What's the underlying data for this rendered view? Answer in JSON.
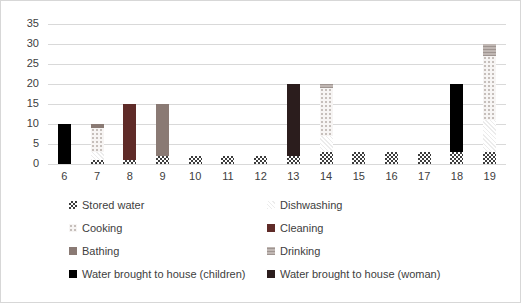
{
  "figure": {
    "background": "#ffffff",
    "border_color": "#d7d7d7",
    "text_color": "#404040",
    "gridline_color": "#d9d9d9"
  },
  "chart_data": {
    "type": "bar",
    "stacked": true,
    "title": "",
    "xlabel": "",
    "ylabel": "",
    "ylim": [
      0,
      35
    ],
    "yticks": [
      35,
      30,
      25,
      20,
      15,
      10,
      5,
      0
    ],
    "grid": "horizontal",
    "legend_position": "bottom-two-columns",
    "categories": [
      "6",
      "7",
      "8",
      "9",
      "10",
      "11",
      "12",
      "13",
      "14",
      "15",
      "16",
      "17",
      "18",
      "19"
    ],
    "series": [
      {
        "name": "Stored water",
        "fill": "checker",
        "color": "#3d3d3d",
        "values": [
          0,
          1,
          1,
          2,
          2,
          2,
          2,
          2,
          3,
          3,
          3,
          3,
          3,
          3
        ]
      },
      {
        "name": "Dishwashing",
        "fill": "diagonal-faint",
        "color": "#f0f0f0",
        "values": [
          0,
          2,
          0,
          0,
          0,
          0,
          0,
          0,
          4,
          0,
          0,
          0,
          0,
          8
        ]
      },
      {
        "name": "Cooking",
        "fill": "dots-light",
        "color": "#dcd6d3",
        "values": [
          0,
          6,
          0,
          0,
          0,
          0,
          0,
          0,
          12,
          0,
          0,
          0,
          0,
          16
        ]
      },
      {
        "name": "Cleaning",
        "fill": "solid",
        "color": "#5f2b28",
        "values": [
          0,
          0,
          14,
          0,
          0,
          0,
          0,
          0,
          0,
          0,
          0,
          0,
          0,
          0
        ]
      },
      {
        "name": "Bathing",
        "fill": "solid",
        "color": "#8a7a74",
        "values": [
          0,
          1,
          0,
          13,
          0,
          0,
          0,
          0,
          0,
          0,
          0,
          0,
          0,
          0
        ]
      },
      {
        "name": "Drinking",
        "fill": "hstripe",
        "color": "#b3a9a5",
        "values": [
          0,
          0,
          0,
          0,
          0,
          0,
          0,
          0,
          1,
          0,
          0,
          0,
          0,
          3
        ]
      },
      {
        "name": "Water brought to house (children)",
        "fill": "solid",
        "color": "#000000",
        "values": [
          10,
          0,
          0,
          0,
          0,
          0,
          0,
          0,
          0,
          0,
          0,
          0,
          17,
          0
        ]
      },
      {
        "name": "Water brought to house (woman)",
        "fill": "solid",
        "color": "#2b1d1d",
        "values": [
          0,
          0,
          0,
          0,
          0,
          0,
          0,
          18,
          0,
          0,
          0,
          0,
          0,
          0
        ]
      }
    ]
  }
}
